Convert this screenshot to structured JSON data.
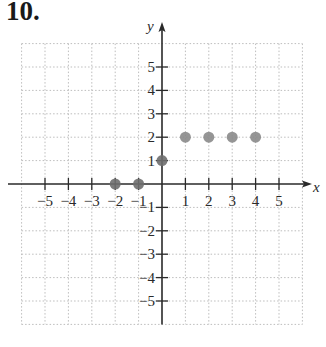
{
  "problem": {
    "number": "10."
  },
  "chart_data": {
    "type": "scatter",
    "title": "",
    "xlabel": "x",
    "ylabel": "y",
    "xlim": [
      -6,
      6
    ],
    "ylim": [
      -6,
      6
    ],
    "grid": true,
    "x_ticks": [
      -5,
      -4,
      -3,
      -2,
      -1,
      1,
      2,
      3,
      4,
      5
    ],
    "y_ticks": [
      -5,
      -4,
      -3,
      -2,
      -1,
      1,
      2,
      3,
      4,
      5
    ],
    "points": [
      {
        "x": -2,
        "y": 0
      },
      {
        "x": -1,
        "y": 0
      },
      {
        "x": 0,
        "y": 1
      },
      {
        "x": 1,
        "y": 2
      },
      {
        "x": 2,
        "y": 2
      },
      {
        "x": 3,
        "y": 2
      },
      {
        "x": 4,
        "y": 2
      }
    ],
    "colors": {
      "point": "#8a8a8a",
      "point_on_axis": "#6e6e6e",
      "axis": "#2a2a2a",
      "grid": "#bdbdbd"
    }
  }
}
